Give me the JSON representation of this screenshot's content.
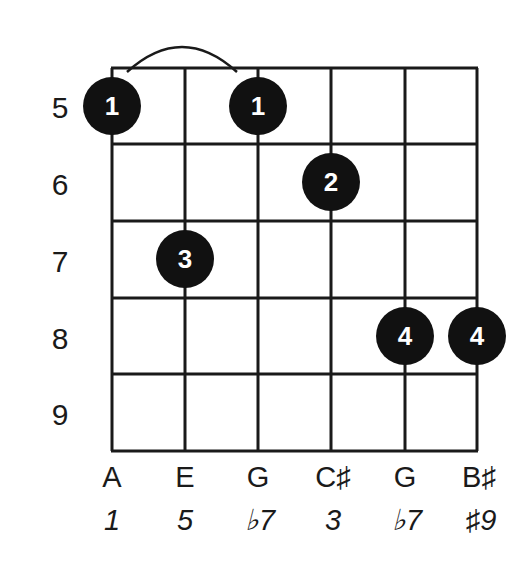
{
  "diagram": {
    "type": "guitar-chord-diagram",
    "colors": {
      "line": "#1a1a1a",
      "dot": "#111111",
      "dot_text": "#ffffff",
      "background": "#ffffff"
    },
    "frets": [
      {
        "number": "5"
      },
      {
        "number": "6"
      },
      {
        "number": "7"
      },
      {
        "number": "8"
      },
      {
        "number": "9"
      }
    ],
    "strings": [
      {
        "note": "A",
        "interval": "1"
      },
      {
        "note": "E",
        "interval": "5"
      },
      {
        "note": "G",
        "interval": "♭7"
      },
      {
        "note": "C♯",
        "interval": "3"
      },
      {
        "note": "G",
        "interval": "♭7"
      },
      {
        "note": "B♯",
        "interval": "♯9"
      }
    ],
    "dots": [
      {
        "string": 1,
        "fret": 5,
        "finger": "1"
      },
      {
        "string": 3,
        "fret": 5,
        "finger": "1"
      },
      {
        "string": 4,
        "fret": 6,
        "finger": "2"
      },
      {
        "string": 2,
        "fret": 7,
        "finger": "3"
      },
      {
        "string": 5,
        "fret": 8,
        "finger": "4"
      },
      {
        "string": 6,
        "fret": 8,
        "finger": "4"
      }
    ],
    "barre": {
      "from_string": 1,
      "to_string": 3,
      "fret": 5
    }
  }
}
